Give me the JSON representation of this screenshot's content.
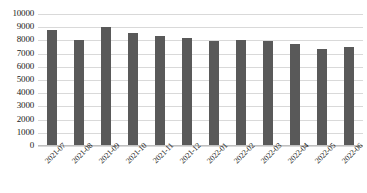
{
  "chart_data": {
    "type": "bar",
    "title": "",
    "xlabel": "",
    "ylabel": "",
    "categories": [
      "2021-07",
      "2021-08",
      "2021-09",
      "2021-10",
      "2021-11",
      "2021-12",
      "2022-01",
      "2022-02",
      "2022-03",
      "2022-04",
      "2022-05",
      "2022-06"
    ],
    "values": [
      8800,
      8050,
      9000,
      8550,
      8350,
      8200,
      7950,
      8000,
      7950,
      7700,
      7350,
      7500
    ],
    "ylim": [
      0,
      10000
    ],
    "ytick_labels": [
      "10000",
      "9000",
      "8000",
      "7000",
      "6000",
      "5000",
      "4000",
      "3000",
      "2000",
      "1000",
      "0"
    ],
    "ytick_values": [
      10000,
      9000,
      8000,
      7000,
      6000,
      5000,
      4000,
      3000,
      2000,
      1000,
      0
    ],
    "grid": true,
    "legend": "none",
    "series_name": "",
    "bar_color": "#595959",
    "gridline_color": "#d9d9d9",
    "axis_color": "#bfbfbf",
    "text_color": "#1a1a1a"
  }
}
